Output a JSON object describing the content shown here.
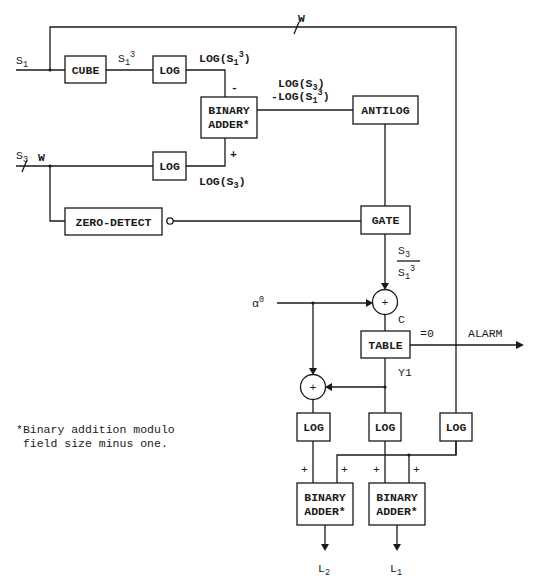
{
  "diagram": {
    "type": "block diagram",
    "inputs": {
      "s1": "S",
      "s1_sub": "1",
      "s3": "S",
      "s3_sub": "3",
      "alpha": "α",
      "alpha_sup": "0"
    },
    "bus_width_label": "W",
    "blocks": {
      "cube": "CUBE",
      "log_s1": "LOG",
      "log_s3": "LOG",
      "adder_top_l1": "BINARY",
      "adder_top_l2": "ADDER*",
      "antilog": "ANTILOG",
      "zero_detect": "ZERO-DETECT",
      "gate": "GATE",
      "table": "TABLE",
      "log_bottom_left": "LOG",
      "log_bottom_mid": "LOG",
      "log_bottom_right": "LOG",
      "adder_l2_l1": "BINARY",
      "adder_l2_l2": "ADDER*",
      "adder_l1_l1": "BINARY",
      "adder_l1_l2": "ADDER*"
    },
    "signals": {
      "s1_cubed_base": "S",
      "s1_cubed_sub": "1",
      "s1_cubed_sup": "3",
      "log_s1_cubed_a": "LOG(S",
      "log_s1_cubed_sub": "1",
      "log_s1_cubed_sup": "3",
      "log_s1_cubed_b": ")",
      "log_s3_a": "LOG(S",
      "log_s3_sub": "3",
      "log_s3_b": ")",
      "diff_line1_a": "LOG(S",
      "diff_line1_sub": "3",
      "diff_line1_b": ")",
      "diff_line2_a": "-LOG(S",
      "diff_line2_sub": "1",
      "diff_line2_sup": "3",
      "diff_line2_b": ")",
      "ratio_num": "S",
      "ratio_num_sub": "3",
      "ratio_den": "S",
      "ratio_den_sub": "1",
      "ratio_den_sup": "3",
      "c": "C",
      "y1": "Y1",
      "eq_zero": "=0",
      "alarm": "ALARM",
      "minus": "-",
      "plus": "+",
      "l2": "L",
      "l2_sub": "2",
      "l1": "L",
      "l1_sub": "1"
    },
    "footnote": {
      "line1": "*Binary addition modulo",
      "line2": " field size minus one."
    }
  }
}
